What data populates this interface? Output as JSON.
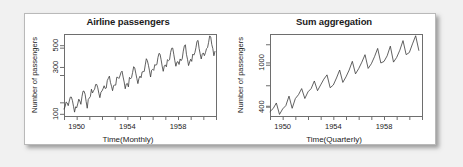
{
  "figure": {
    "background_color": "#f1f1f1",
    "card_color": "#ffffff",
    "border_color": "#b9b9b9",
    "line_color": "#3a3a3a",
    "axis_color": "#6e6e6e"
  },
  "chart_data": [
    {
      "type": "line",
      "title": "Airline passengers",
      "xlabel": "Time(Monthly)",
      "ylabel": "Number of passengers",
      "grid": false,
      "legend": "none",
      "yscale": "log",
      "ytick_labels": [
        "100",
        "300",
        "500"
      ],
      "ytick_values": [
        100,
        300,
        500
      ],
      "ylim": [
        95,
        650
      ],
      "xtick_labels": [
        "1950",
        "1954",
        "1958"
      ],
      "xtick_values": [
        1950,
        1954,
        1958
      ],
      "xlim": [
        1949.0,
        1961.0
      ],
      "x_start": 1949.0,
      "x_step": 0.08333,
      "values": [
        112,
        118,
        132,
        129,
        121,
        135,
        148,
        148,
        136,
        119,
        104,
        118,
        115,
        126,
        141,
        135,
        125,
        149,
        170,
        170,
        158,
        133,
        114,
        140,
        145,
        150,
        178,
        163,
        172,
        178,
        199,
        199,
        184,
        162,
        146,
        166,
        171,
        180,
        193,
        181,
        183,
        218,
        230,
        242,
        209,
        191,
        172,
        194,
        196,
        196,
        236,
        235,
        229,
        243,
        264,
        272,
        237,
        211,
        180,
        201,
        204,
        188,
        235,
        227,
        234,
        264,
        302,
        293,
        259,
        229,
        203,
        229,
        242,
        233,
        267,
        269,
        270,
        315,
        364,
        347,
        312,
        274,
        237,
        278,
        284,
        277,
        317,
        313,
        318,
        374,
        413,
        405,
        355,
        306,
        271,
        306,
        315,
        301,
        356,
        348,
        355,
        422,
        465,
        467,
        404,
        347,
        305,
        336,
        340,
        318,
        362,
        348,
        363,
        435,
        491,
        505,
        404,
        359,
        310,
        337,
        360,
        342,
        406,
        396,
        420,
        472,
        548,
        559,
        463,
        407,
        362,
        405,
        417,
        391,
        419,
        461,
        472,
        535,
        622,
        606,
        508,
        461,
        390,
        432
      ]
    },
    {
      "type": "line",
      "title": "Sum aggregation",
      "xlabel": "Time(Quarterly)",
      "ylabel": "Number of passengers",
      "grid": false,
      "legend": "none",
      "yscale": "log",
      "ytick_labels": [
        "400",
        "1000"
      ],
      "ytick_values": [
        400,
        1000
      ],
      "ylim": [
        330,
        1800
      ],
      "xtick_labels": [
        "1950",
        "1954",
        "1958"
      ],
      "xtick_values": [
        1950,
        1954,
        1958
      ],
      "xlim": [
        1949.0,
        1961.0
      ],
      "x_start": 1949.0,
      "x_step": 0.25,
      "values": [
        362,
        385,
        432,
        341,
        382,
        409,
        498,
        387,
        473,
        513,
        582,
        474,
        544,
        582,
        681,
        557,
        628,
        707,
        773,
        592,
        627,
        725,
        854,
        661,
        742,
        854,
        1023,
        789,
        878,
        1005,
        1173,
        883,
        972,
        1125,
        1336,
        988,
        1020,
        1146,
        1400,
        1006,
        1108,
        1288,
        1570,
        1174,
        1227,
        1468,
        1736,
        1283
      ]
    }
  ]
}
